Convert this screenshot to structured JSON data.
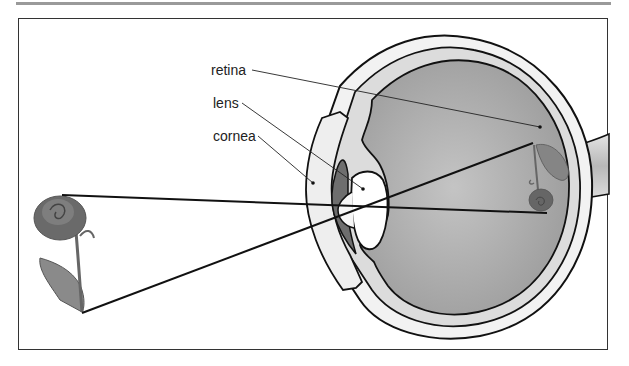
{
  "figure": {
    "labels": [
      {
        "id": "retina",
        "text": "retina"
      },
      {
        "id": "lens",
        "text": "lens"
      },
      {
        "id": "cornea",
        "text": "cornea"
      }
    ],
    "object": {
      "name": "rose",
      "orientation": "upright"
    },
    "image": {
      "name": "rose",
      "orientation": "inverted",
      "location": "retina"
    },
    "rays": [
      {
        "from": "rose-top",
        "to": "retina-image-bottom"
      },
      {
        "from": "rose-bottom",
        "to": "retina-image-top"
      }
    ]
  },
  "colors": {
    "frame": "#333333",
    "top_rule": "#9a9a9a",
    "vitreous": "#a8a8a8",
    "sclera": "#efefef",
    "iris": "#6e6e6e",
    "rose": "#6a6a6a"
  }
}
